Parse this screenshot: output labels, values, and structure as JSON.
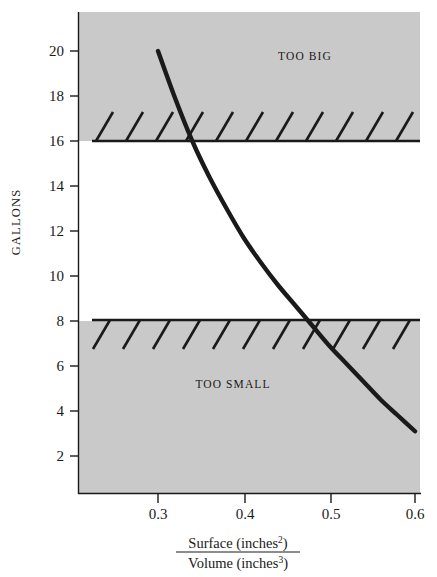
{
  "chart_data": {
    "type": "line",
    "title": "",
    "xlabel": "Surface (inches²) / Volume (inches³)",
    "ylabel": "GALLONS",
    "xlim": [
      0.215,
      0.607
    ],
    "ylim": [
      0,
      21.1
    ],
    "grid": false,
    "legend": "none",
    "xticks": [
      0.3,
      0.4,
      0.5,
      0.6
    ],
    "xtick_labels": [
      "0.3",
      "0.4",
      "0.5",
      "0.6"
    ],
    "yticks": [
      2,
      4,
      6,
      8,
      10,
      12,
      14,
      16,
      18,
      20
    ],
    "ytick_labels": [
      "2",
      "4",
      "6",
      "8",
      "10",
      "12",
      "14",
      "16",
      "18",
      "20"
    ],
    "series": [
      {
        "name": "surface-to-volume ratio curve",
        "x": [
          0.3,
          0.32,
          0.34,
          0.36,
          0.38,
          0.4,
          0.42,
          0.44,
          0.46,
          0.48,
          0.5,
          0.52,
          0.54,
          0.56,
          0.58,
          0.6
        ],
        "y": [
          20.0,
          17.9,
          16.0,
          14.4,
          13.0,
          11.7,
          10.6,
          9.6,
          8.7,
          7.8,
          6.9,
          6.1,
          5.3,
          4.5,
          3.8,
          3.1
        ]
      }
    ],
    "threshold_lines": [
      {
        "name": "too-big-boundary",
        "y": 16,
        "hatch_side": "above",
        "label": "TOO BIG"
      },
      {
        "name": "too-small-boundary",
        "y": 8,
        "hatch_side": "below",
        "label": "TOO SMALL"
      }
    ],
    "shaded_regions": [
      {
        "name": "too-big-region",
        "y_from": 16,
        "y_to": 21.1,
        "label": "TOO BIG",
        "color": "#c9c9c9"
      },
      {
        "name": "too-small-region",
        "y_from": 0,
        "y_to": 8,
        "label": "TOO SMALL",
        "color": "#c9c9c9"
      }
    ],
    "intersections": [
      {
        "name": "curve-crosses-too-big",
        "x": 0.34,
        "y": 16
      },
      {
        "name": "curve-crosses-too-small",
        "x": 0.47,
        "y": 8
      }
    ],
    "acceptable_range": {
      "x_min": 0.34,
      "x_max": 0.47,
      "y_min": 8,
      "y_max": 16
    }
  },
  "axes": {
    "y_axis_title": "GALLONS",
    "x_axis_numerator": "Surface (inches",
    "x_axis_numerator_sup": "2",
    "x_axis_numerator_close": ")",
    "x_axis_denominator": "Volume (inches",
    "x_axis_denominator_sup": "3",
    "x_axis_denominator_close": ")"
  },
  "labels": {
    "too_big": "TOO BIG",
    "too_small": "TOO SMALL"
  },
  "ticks": {
    "y": [
      {
        "value": "20",
        "px": 51
      },
      {
        "value": "18",
        "px": 96
      },
      {
        "value": "16",
        "px": 141
      },
      {
        "value": "14",
        "px": 186
      },
      {
        "value": "12",
        "px": 231
      },
      {
        "value": "10",
        "px": 276
      },
      {
        "value": "8",
        "px": 321
      },
      {
        "value": "6",
        "px": 366
      },
      {
        "value": "4",
        "px": 411
      },
      {
        "value": "2",
        "px": 456
      }
    ],
    "x": [
      {
        "value": "0.3",
        "px": 158
      },
      {
        "value": "0.4",
        "px": 245
      },
      {
        "value": "0.5",
        "px": 331
      },
      {
        "value": "0.6",
        "px": 415
      }
    ]
  },
  "colors": {
    "shade": "#c9c9c9",
    "ink": "#1a1a1a",
    "background": "#ffffff"
  }
}
